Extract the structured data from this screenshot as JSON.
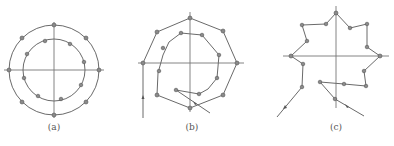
{
  "figure": {
    "panels": [
      {
        "id": "a",
        "caption": "(a)",
        "description": "Two concentric circles with axes; 8 nodes on outer circle, 10 nodes on inner circle",
        "center": [
          54,
          70
        ],
        "outer_radius": 45,
        "inner_radius": 31,
        "outer_nodes": 8,
        "inner_nodes": 10
      },
      {
        "id": "b",
        "caption": "(b)",
        "description": "Octagonal outer path with inner spiral, entry line from left bottom, exit segment crossing lower right",
        "outer_path": [
          [
            143,
            63
          ],
          [
            157,
            32
          ],
          [
            190,
            18
          ],
          [
            223,
            31
          ],
          [
            237,
            63
          ],
          [
            223,
            95
          ],
          [
            190,
            108
          ],
          [
            157,
            95
          ]
        ],
        "inner_path": [
          [
            190,
            108
          ],
          [
            157,
            95
          ],
          [
            158,
            73
          ],
          [
            163,
            55
          ],
          [
            169,
            42
          ],
          [
            181,
            33
          ],
          [
            202,
            35
          ],
          [
            219,
            55
          ],
          [
            217,
            78
          ],
          [
            208,
            89
          ],
          [
            199,
            94
          ],
          [
            176,
            90
          ]
        ],
        "entry_line": [
          [
            143,
            63
          ],
          [
            143,
            118
          ]
        ],
        "exit_line": [
          [
            176,
            90
          ],
          [
            210,
            113
          ]
        ]
      },
      {
        "id": "c",
        "caption": "(c)",
        "description": "Star-shaped (maple-leaf-like) path with axes, inbound arrow from lower left, outbound arrow to lower right",
        "path": [
          [
            277,
            117
          ],
          [
            302,
            87
          ],
          [
            303,
            64
          ],
          [
            291,
            56
          ],
          [
            307,
            41
          ],
          [
            302,
            25
          ],
          [
            326,
            24
          ],
          [
            336,
            13
          ],
          [
            350,
            28
          ],
          [
            367,
            24
          ],
          [
            367,
            47
          ],
          [
            380,
            56
          ],
          [
            364,
            71
          ],
          [
            366,
            86
          ],
          [
            344,
            84
          ],
          [
            320,
            82
          ],
          [
            335,
            99
          ],
          [
            364,
            116
          ]
        ]
      }
    ],
    "colors": {
      "line": "#6a6a6a",
      "axis": "#777777",
      "node": "#8a8a8a",
      "caption": "#555555"
    }
  }
}
